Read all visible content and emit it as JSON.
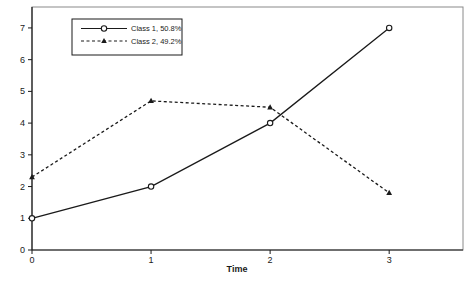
{
  "figure": {
    "background": "#ffffff",
    "frame_color": "#8a8a8a",
    "axis_color": "#1a1a1a",
    "line_color": "#1a1a1a"
  },
  "chart_data": {
    "type": "line",
    "title": "",
    "xlabel": "Time",
    "ylabel": "",
    "x": [
      0,
      1,
      2,
      3
    ],
    "xticks": [
      "0",
      "1",
      "2",
      "3"
    ],
    "yticks": [
      "0",
      "1",
      "2",
      "3",
      "4",
      "5",
      "6",
      "7"
    ],
    "xlim": [
      0,
      3.62
    ],
    "ylim": [
      0,
      7.66
    ],
    "grid": false,
    "legend_position": "top-left",
    "series": [
      {
        "name": "Class 1, 50.8%",
        "values": [
          1,
          2,
          4,
          7
        ],
        "style": "solid",
        "marker": "circle",
        "color": "#1a1a1a"
      },
      {
        "name": "Class 2, 49.2%",
        "values": [
          2.3,
          4.7,
          4.5,
          1.8
        ],
        "style": "dashed",
        "marker": "triangle",
        "color": "#1a1a1a"
      }
    ]
  }
}
